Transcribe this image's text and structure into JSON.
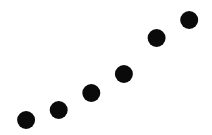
{
  "chart_data": {
    "type": "scatter",
    "title": "",
    "xlabel": "",
    "ylabel": "",
    "x": [
      1,
      2,
      3,
      4,
      5,
      6
    ],
    "y": [
      15,
      25,
      42,
      61,
      97,
      115
    ],
    "xlim": [
      0.2,
      6.7
    ],
    "ylim": [
      0,
      135
    ],
    "grid": false,
    "axes_visible": false,
    "legend": "none",
    "marker_color": "#0a0a0a",
    "background_color": "#ffffff"
  }
}
